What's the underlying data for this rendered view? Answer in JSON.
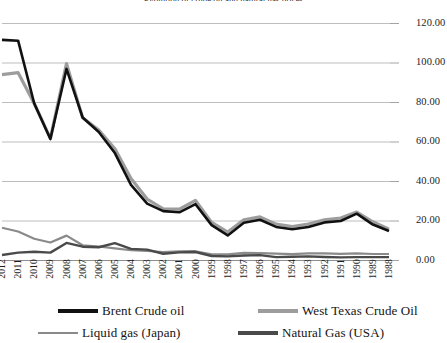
{
  "chart_data": {
    "type": "line",
    "title": "Evolution of crude oil and natural gas prices",
    "xlabel": "",
    "ylabel": "",
    "ylim": [
      0,
      120
    ],
    "ytick_step": 20,
    "ytick_labels": [
      "120.00",
      "100.00",
      "80.00",
      "60.00",
      "40.00",
      "20.00",
      "0.00"
    ],
    "grid": true,
    "x_reversed": true,
    "legend_position": "bottom",
    "categories": [
      "2012",
      "2011",
      "2010",
      "2009",
      "2008",
      "2007",
      "2006",
      "2005",
      "2004",
      "2003",
      "2002",
      "2001",
      "2000",
      "1999",
      "1998",
      "1997",
      "1996",
      "1995",
      "1994",
      "1993",
      "1992",
      "1991",
      "1990",
      "1989",
      "1988"
    ],
    "series": [
      {
        "name": "Brent Crude oil",
        "color": "#111111",
        "width": 2.6,
        "values": [
          111.7,
          111.3,
          79.5,
          61.5,
          97.0,
          72.4,
          65.1,
          54.4,
          38.3,
          28.8,
          25.0,
          24.4,
          28.5,
          17.9,
          12.7,
          19.1,
          20.6,
          17.0,
          15.8,
          17.0,
          19.3,
          20.0,
          23.7,
          18.2,
          14.9
        ]
      },
      {
        "name": "West Texas Crude Oil",
        "color": "#9d9d9d",
        "width": 3.2,
        "values": [
          94.1,
          95.1,
          79.5,
          61.8,
          99.7,
          72.3,
          66.1,
          56.6,
          41.5,
          31.1,
          26.2,
          26.0,
          30.4,
          19.3,
          14.4,
          20.6,
          22.1,
          18.4,
          17.2,
          18.4,
          20.6,
          21.5,
          24.5,
          19.6,
          15.9
        ]
      },
      {
        "name": "Liquid gas (Japan)",
        "color": "#8a8a8a",
        "width": 2.2,
        "values": [
          16.6,
          14.7,
          11.0,
          9.1,
          12.6,
          7.7,
          7.1,
          6.1,
          5.2,
          4.8,
          4.3,
          4.6,
          4.7,
          3.1,
          3.1,
          3.9,
          3.7,
          3.5,
          3.2,
          3.6,
          3.6,
          3.4,
          3.6,
          3.3,
          3.3
        ]
      },
      {
        "name": "Natural Gas (USA)",
        "color": "#4a4a4a",
        "width": 2.4,
        "values": [
          2.8,
          4.0,
          4.4,
          4.0,
          8.9,
          7.0,
          6.7,
          8.8,
          5.9,
          5.5,
          3.4,
          4.1,
          4.3,
          2.3,
          2.1,
          2.5,
          2.7,
          1.7,
          1.9,
          2.1,
          1.8,
          1.6,
          1.7,
          1.7,
          1.7
        ]
      }
    ]
  },
  "legend": {
    "items": [
      {
        "label": "Brent Crude oil",
        "color": "#111111",
        "thickness": "3.5px"
      },
      {
        "label": "West Texas Crude Oil",
        "color": "#9d9d9d",
        "thickness": "3.5px"
      },
      {
        "label": "Liquid gas (Japan)",
        "color": "#8a8a8a",
        "thickness": "2.5px"
      },
      {
        "label": "Natural Gas (USA)",
        "color": "#4a4a4a",
        "thickness": "3.5px"
      }
    ]
  },
  "axis": {
    "y_labels": [
      "120.00",
      "100.00",
      "80.00",
      "60.00",
      "40.00",
      "20.00",
      "0.00"
    ],
    "x_labels": [
      "2012",
      "2011",
      "2010",
      "2009",
      "2008",
      "2007",
      "2006",
      "2005",
      "2004",
      "2003",
      "2002",
      "2001",
      "2000",
      "1999",
      "1998",
      "1997",
      "1996",
      "1995",
      "1994",
      "1993",
      "1992",
      "1991",
      "1990",
      "1989",
      "1988"
    ]
  }
}
